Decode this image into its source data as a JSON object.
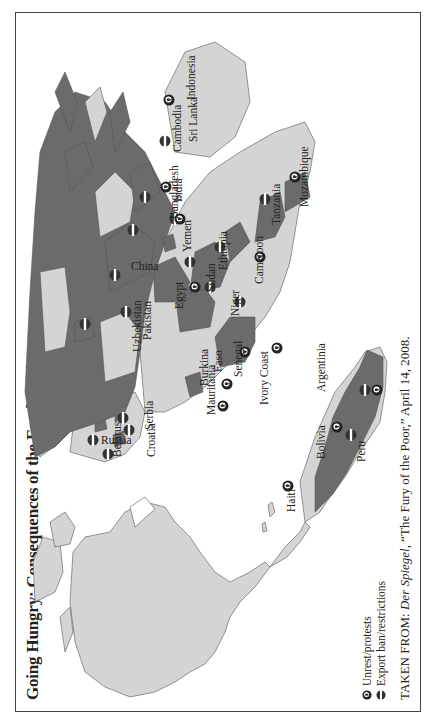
{
  "title": "Going Hungry: Consequences of the Food Crisis",
  "colors": {
    "affected_country": "#6b6b6b",
    "other_country": "#d4d4d4",
    "ocean": "#ffffff",
    "border": "#444444"
  },
  "legend": {
    "items": [
      {
        "icon": "unrest-protest-icon",
        "label": "Unrest/protests"
      },
      {
        "icon": "export-ban-icon",
        "label": "Export ban/restrictions"
      }
    ]
  },
  "source": {
    "prefix": "TAKEN FROM: ",
    "publication": "Der Spiegel",
    "rest": ", “The Fury of the Poor,” April 14, 2008."
  },
  "countries": [
    {
      "name": "Russia",
      "markers": [
        "export-ban"
      ]
    },
    {
      "name": "China",
      "markers": [
        "export-ban"
      ]
    },
    {
      "name": "Uzbekistan",
      "markers": [
        "export-ban"
      ]
    },
    {
      "name": "Pakistan",
      "markers": [
        "export-ban"
      ]
    },
    {
      "name": "India",
      "markers": [
        "export-ban",
        "unrest"
      ]
    },
    {
      "name": "Bangladesh",
      "markers": [
        "export-ban"
      ]
    },
    {
      "name": "Cambodia",
      "markers": [
        "export-ban"
      ]
    },
    {
      "name": "Sri Lanka",
      "markers": [
        "export-ban"
      ]
    },
    {
      "name": "Indonesia",
      "markers": [
        "unrest"
      ]
    },
    {
      "name": "Yemen",
      "markers": [
        "unrest"
      ]
    },
    {
      "name": "Ethiopia",
      "markers": [
        "export-ban"
      ]
    },
    {
      "name": "Egypt",
      "markers": [
        "unrest",
        "export-ban"
      ]
    },
    {
      "name": "Sudan",
      "markers": [
        "export-ban"
      ]
    },
    {
      "name": "Tanzania",
      "markers": [
        "export-ban"
      ]
    },
    {
      "name": "Mozambique",
      "markers": [
        "unrest"
      ]
    },
    {
      "name": "Cameroon",
      "markers": [
        "unrest"
      ]
    },
    {
      "name": "Niger",
      "markers": [
        "export-ban"
      ]
    },
    {
      "name": "Burkina Faso",
      "markers": [
        "unrest"
      ]
    },
    {
      "name": "Ivory Coast",
      "markers": [
        "unrest"
      ]
    },
    {
      "name": "Senegal",
      "markers": [
        "unrest"
      ]
    },
    {
      "name": "Mauritania",
      "markers": [
        "unrest"
      ]
    },
    {
      "name": "Belarus",
      "markers": [
        "export-ban"
      ]
    },
    {
      "name": "Croatia",
      "markers": [
        "export-ban"
      ]
    },
    {
      "name": "Serbia",
      "markers": [
        "export-ban"
      ]
    },
    {
      "name": "Haiti",
      "markers": [
        "unrest"
      ]
    },
    {
      "name": "Peru",
      "markers": [
        "unrest"
      ]
    },
    {
      "name": "Bolivia",
      "markers": [
        "export-ban"
      ]
    },
    {
      "name": "Argentinia",
      "markers": [
        "export-ban",
        "unrest"
      ]
    }
  ],
  "labels": {
    "russia": "Russia",
    "china": "China",
    "uzbekistan": "Uzbekistan",
    "pakistan": "Pakistan",
    "india": "India",
    "bangladesh": "Bangladesh",
    "cambodia": "Cambodia",
    "sri_lanka": "Sri Lanka",
    "indonesia": "Indonesia",
    "yemen": "Yemen",
    "ethiopia": "Ethiopia",
    "egypt": "Egypt",
    "sudan": "Sudan",
    "tanzania": "Tanzania",
    "mozambique": "Mozambique",
    "cameroon": "Cameroon",
    "niger": "Niger",
    "burkina": "Burkina",
    "faso": "Faso",
    "ivory_coast": "Ivory Coast",
    "senegal": "Senegal",
    "mauritania": "Mauritania",
    "belarus": "Belarus",
    "croatia": "Croatia",
    "serbia": "Serbia",
    "haiti": "Haiti",
    "peru": "Peru",
    "bolivia": "Bolivia",
    "argentinia": "Argentinia"
  }
}
